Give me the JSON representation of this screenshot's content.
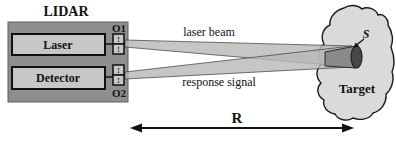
{
  "diagram": {
    "title": "LIDAR",
    "lidar_unit": {
      "laser_label": "Laser",
      "detector_label": "Detector",
      "optic1_label": "O1",
      "optic2_label": "O2",
      "lens_icon": "↕"
    },
    "beams": {
      "laser_beam_label": "laser beam",
      "response_signal_label": "response signal"
    },
    "target": {
      "label": "Target",
      "spot_label": "S"
    },
    "range": {
      "label": "R"
    }
  },
  "palette": {
    "background": "#ffffff",
    "lidar_unit_fill": "#8e8e8e",
    "component_fill": "#c7c7c7",
    "beam_fill": "#b8b8b8",
    "target_fill": "#dadada",
    "cylinder_fill": "#8a8a8a",
    "spot_fill": "#474747",
    "outline": "#1a1a1a",
    "text": "#111111"
  }
}
